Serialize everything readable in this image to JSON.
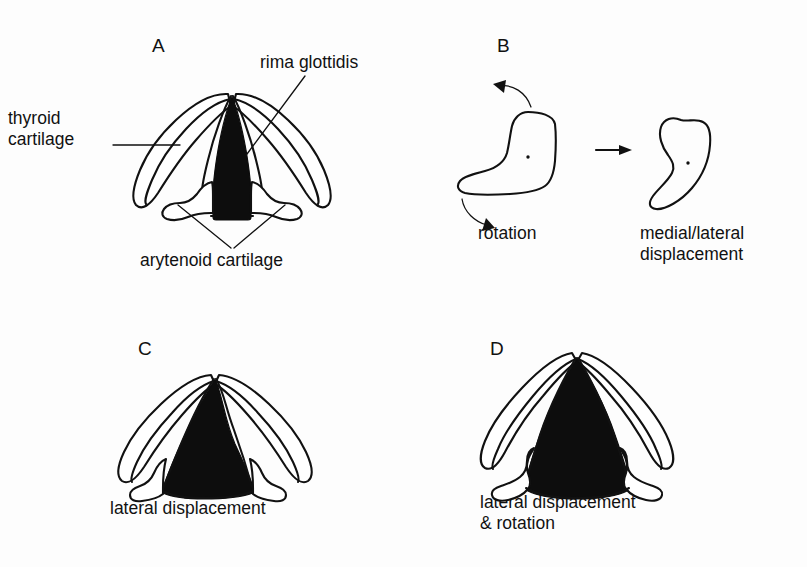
{
  "figure": {
    "background_color": "#fdfdfd",
    "ink_color": "#111111",
    "glottis_fill_color": "#0d0d0d"
  },
  "panels": [
    {
      "id": "A",
      "letter": "A",
      "description": "Normal larynx viewed from above",
      "labels": [
        {
          "name": "rima-glottidis",
          "text": "rima glottidis"
        },
        {
          "name": "thyroid-cartilage",
          "text": "thyroid\ncartilage"
        },
        {
          "name": "arytenoid-cartilage",
          "text": "arytenoid cartilage"
        }
      ]
    },
    {
      "id": "B",
      "letter": "B",
      "description": "Arytenoid cartilage motions",
      "labels": [
        {
          "name": "rotation",
          "text": "rotation"
        },
        {
          "name": "medial-lateral-displacement",
          "text": "medial/lateral\ndisplacement"
        }
      ]
    },
    {
      "id": "C",
      "letter": "C",
      "description": "Larynx with laterally displaced arytenoids",
      "labels": [
        {
          "name": "lateral-displacement",
          "text": "lateral displacement"
        }
      ]
    },
    {
      "id": "D",
      "letter": "D",
      "description": "Larynx with lateral displacement and rotation",
      "labels": [
        {
          "name": "lateral-displacement-and-rotation",
          "text": "lateral displacement\n& rotation"
        }
      ]
    }
  ]
}
